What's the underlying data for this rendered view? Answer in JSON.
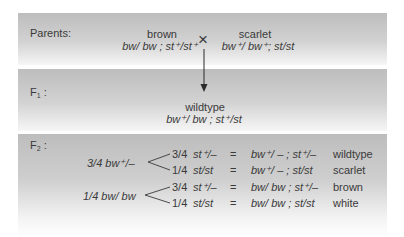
{
  "parents": {
    "label": "Parents:",
    "left": {
      "phenotype": "brown",
      "genotype": "bw/ bw ; st⁺/st⁺"
    },
    "cross_symbol": "×",
    "right": {
      "phenotype": "scarlet",
      "genotype": "bw⁺/ bw⁺; st/st"
    }
  },
  "f1": {
    "label_main": "F",
    "label_sub": "1",
    "label_colon": " :",
    "phenotype": "wildtype",
    "genotype": "bw⁺/ bw ; st⁺/st"
  },
  "f2": {
    "label_main": "F",
    "label_sub": "2",
    "label_colon": " :",
    "groups": [
      {
        "parent": "3/4 bw⁺/–",
        "rows": [
          {
            "fraction": "3/4",
            "st": "st⁺/–",
            "eq": "=",
            "genotype": "bw⁺/ – ; st⁺/–",
            "phenotype": "wildtype"
          },
          {
            "fraction": "1/4",
            "st": "st/st",
            "eq": "=",
            "genotype": "bw⁺/ – ; st/st",
            "phenotype": "scarlet"
          }
        ]
      },
      {
        "parent": "1/4 bw/ bw",
        "rows": [
          {
            "fraction": "3/4",
            "st": "st⁺/–",
            "eq": "=",
            "genotype": "bw/ bw ; st⁺/–",
            "phenotype": "brown"
          },
          {
            "fraction": "1/4",
            "st": "st/st",
            "eq": "=",
            "genotype": "bw/ bw ; st/st",
            "phenotype": "white"
          }
        ]
      }
    ]
  }
}
